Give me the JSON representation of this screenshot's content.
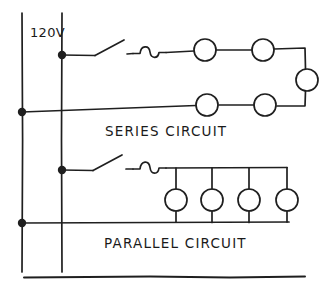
{
  "diagram": {
    "ink_color": "#1f1f1f",
    "background_color": "#ffffff",
    "supply_label": "120V",
    "sections": [
      {
        "name": "series-circuit",
        "caption": "SERIES  CIRCUIT",
        "caption_text": "SERIES CIRCUIT",
        "switch": "open-knife-switch",
        "fuse": "fuse-squiggle",
        "lamp_count": 5,
        "lamps": [
          {
            "label": "lamp-1",
            "cx": 205,
            "cy": 50
          },
          {
            "label": "lamp-2",
            "cx": 263,
            "cy": 50
          },
          {
            "label": "lamp-3",
            "cx": 307,
            "cy": 80
          },
          {
            "label": "lamp-4",
            "cx": 265,
            "cy": 105
          },
          {
            "label": "lamp-5",
            "cx": 207,
            "cy": 105
          }
        ]
      },
      {
        "name": "parallel-circuit",
        "caption": "PARALLEL  CIRCUIT",
        "caption_text": "PARALLEL CIRCUIT",
        "switch": "open-knife-switch",
        "fuse": "fuse-squiggle",
        "lamp_count": 4,
        "lamps": [
          {
            "label": "lamp-1",
            "cx": 176,
            "cy": 200
          },
          {
            "label": "lamp-2",
            "cx": 212,
            "cy": 200
          },
          {
            "label": "lamp-3",
            "cx": 249,
            "cy": 200
          },
          {
            "label": "lamp-4",
            "cx": 287,
            "cy": 200
          }
        ]
      }
    ],
    "buses": [
      {
        "name": "neutral-bus-left",
        "x": 22,
        "y1": 13,
        "y2": 272
      },
      {
        "name": "hot-bus",
        "x": 62,
        "y1": 13,
        "y2": 272
      }
    ],
    "junction_dots": [
      {
        "name": "junction-hot-series",
        "cx": 62,
        "cy": 55
      },
      {
        "name": "junction-neutral-series",
        "cx": 22,
        "cy": 112
      },
      {
        "name": "junction-hot-parallel",
        "cx": 62,
        "cy": 170
      },
      {
        "name": "junction-neutral-parallel",
        "cx": 22,
        "cy": 223
      }
    ],
    "bottom_rule": {
      "name": "bottom-border-line",
      "x1": 24,
      "x2": 305,
      "y": 277
    }
  }
}
